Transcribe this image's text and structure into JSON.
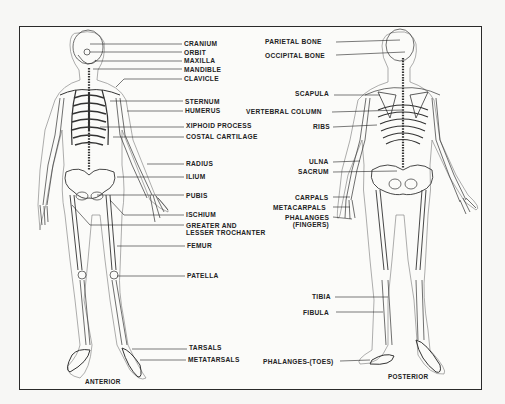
{
  "figure": {
    "views": [
      {
        "id": "anterior",
        "caption": "ANTERIOR"
      },
      {
        "id": "posterior",
        "caption": "POSTERIOR"
      }
    ]
  },
  "anterior_labels": [
    {
      "text": "CRANIUM",
      "x": 184,
      "y": 40,
      "line": [
        [
          90,
          44
        ],
        [
          182,
          44
        ]
      ]
    },
    {
      "text": "ORBIT",
      "x": 184,
      "y": 49,
      "line": [
        [
          90,
          52
        ],
        [
          182,
          52
        ]
      ]
    },
    {
      "text": "MAXILLA",
      "x": 184,
      "y": 57,
      "line": [
        [
          95,
          61
        ],
        [
          182,
          61
        ]
      ]
    },
    {
      "text": "MANDIBLE",
      "x": 184,
      "y": 66,
      "line": [
        [
          93,
          69
        ],
        [
          182,
          69
        ]
      ]
    },
    {
      "text": "CLAVICLE",
      "x": 184,
      "y": 75,
      "line": [
        [
          116,
          87
        ],
        [
          124,
          79
        ],
        [
          182,
          79
        ]
      ]
    },
    {
      "text": "STERNUM",
      "x": 185,
      "y": 98,
      "line": [
        [
          110,
          101
        ],
        [
          183,
          101
        ]
      ]
    },
    {
      "text": "HUMERUS",
      "x": 185,
      "y": 107,
      "line": [
        [
          127,
          111
        ],
        [
          183,
          111
        ]
      ]
    },
    {
      "text": "XIPHOID PROCESS",
      "x": 186,
      "y": 122,
      "line": [
        [
          100,
          127
        ],
        [
          184,
          127
        ]
      ]
    },
    {
      "text": "COSTAL CARTILAGE",
      "x": 186,
      "y": 133,
      "line": [
        [
          113,
          137
        ],
        [
          184,
          137
        ]
      ]
    },
    {
      "text": "RADIUS",
      "x": 186,
      "y": 160,
      "line": [
        [
          147,
          164
        ],
        [
          184,
          164
        ]
      ]
    },
    {
      "text": "ILIUM",
      "x": 186,
      "y": 173,
      "line": [
        [
          117,
          177
        ],
        [
          184,
          177
        ]
      ]
    },
    {
      "text": "PUBIS",
      "x": 186,
      "y": 192,
      "line": [
        [
          97,
          195
        ],
        [
          184,
          195
        ]
      ]
    },
    {
      "text": "ISCHIUM",
      "x": 186,
      "y": 211,
      "line": [
        [
          110,
          200
        ],
        [
          124,
          215
        ],
        [
          184,
          215
        ]
      ]
    },
    {
      "text": "GREATER AND\nLESSER TROCHANTER",
      "x": 186,
      "y": 222,
      "line": [
        [
          72,
          205
        ],
        [
          90,
          225
        ],
        [
          184,
          225
        ]
      ]
    },
    {
      "text": "FEMUR",
      "x": 187,
      "y": 242,
      "line": [
        [
          117,
          246
        ],
        [
          185,
          246
        ]
      ]
    },
    {
      "text": "PATELLA",
      "x": 187,
      "y": 272,
      "line": [
        [
          117,
          276
        ],
        [
          185,
          276
        ]
      ]
    },
    {
      "text": "TARSALS",
      "x": 189,
      "y": 344,
      "line": [
        [
          132,
          349
        ],
        [
          187,
          349
        ]
      ]
    },
    {
      "text": "METATARSALS",
      "x": 188,
      "y": 356,
      "line": [
        [
          140,
          360
        ],
        [
          186,
          360
        ]
      ]
    }
  ],
  "posterior_labels": [
    {
      "text": "PARIETAL BONE",
      "x": 265,
      "y": 38,
      "anchor": "right",
      "line": [
        [
          336,
          42
        ],
        [
          400,
          40
        ]
      ]
    },
    {
      "text": "OCCIPITAL BONE",
      "x": 265,
      "y": 52,
      "anchor": "right",
      "line": [
        [
          336,
          55
        ],
        [
          405,
          52
        ]
      ]
    },
    {
      "text": "SCAPULA",
      "x": 295,
      "y": 90,
      "anchor": "right",
      "line": [
        [
          334,
          95
        ],
        [
          380,
          95
        ]
      ]
    },
    {
      "text": "VERTEBRAL COLUMN",
      "x": 246,
      "y": 108,
      "anchor": "right",
      "line": [
        [
          332,
          112
        ],
        [
          402,
          110
        ]
      ]
    },
    {
      "text": "RIBS",
      "x": 313,
      "y": 123,
      "anchor": "right",
      "line": [
        [
          333,
          127
        ],
        [
          377,
          125
        ]
      ]
    },
    {
      "text": "ULNA",
      "x": 309,
      "y": 158,
      "anchor": "right",
      "line": [
        [
          333,
          162
        ],
        [
          360,
          161
        ]
      ]
    },
    {
      "text": "SACRUM",
      "x": 298,
      "y": 168,
      "anchor": "right",
      "line": [
        [
          333,
          172
        ],
        [
          397,
          171
        ]
      ]
    },
    {
      "text": "CARPALS",
      "x": 295,
      "y": 194,
      "anchor": "right",
      "line": [
        [
          333,
          197
        ],
        [
          350,
          197
        ]
      ]
    },
    {
      "text": "METACARPALS",
      "x": 273,
      "y": 204,
      "anchor": "right",
      "line": [
        [
          333,
          207
        ],
        [
          350,
          207
        ]
      ]
    },
    {
      "text": "PHALANGES\n(FINGERS)",
      "x": 285,
      "y": 214,
      "anchor": "right",
      "line": [
        [
          333,
          217
        ],
        [
          352,
          219
        ]
      ]
    },
    {
      "text": "TIBIA",
      "x": 312,
      "y": 293,
      "anchor": "right",
      "line": [
        [
          335,
          297
        ],
        [
          388,
          297
        ]
      ]
    },
    {
      "text": "FIBULA",
      "x": 303,
      "y": 309,
      "anchor": "right",
      "line": [
        [
          336,
          312
        ],
        [
          383,
          312
        ]
      ]
    },
    {
      "text": "PHALANGES-(TOES)",
      "x": 263,
      "y": 358,
      "anchor": "right",
      "line": [
        [
          340,
          361
        ],
        [
          370,
          360
        ]
      ]
    }
  ]
}
